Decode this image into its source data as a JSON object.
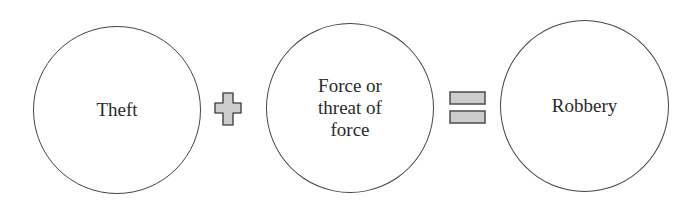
{
  "diagram": {
    "nodes": [
      {
        "id": "theft",
        "label": "Theft"
      },
      {
        "id": "force",
        "label_lines": [
          "Force or",
          "threat of",
          "force"
        ]
      },
      {
        "id": "robbery",
        "label": "Robbery"
      }
    ],
    "operators": [
      {
        "symbol": "plus",
        "between": [
          "theft",
          "force"
        ]
      },
      {
        "symbol": "equals",
        "between": [
          "force",
          "robbery"
        ]
      }
    ],
    "colors": {
      "circle_stroke": "#444444",
      "operator_fill": "#cccccc",
      "operator_stroke": "#555555",
      "text": "#2a2a2a"
    }
  }
}
